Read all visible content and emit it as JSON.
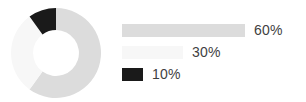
{
  "chart_data": {
    "type": "pie",
    "variant": "donut",
    "title": "",
    "subtitle": "",
    "xlabel": "",
    "ylabel": "",
    "grid": false,
    "legend_position": "right",
    "start_angle_deg": 0,
    "direction": "clockwise",
    "inner_radius_ratio": 0.51,
    "labels": [
      "60%",
      "30%",
      "10%"
    ],
    "values": [
      60,
      30,
      10
    ],
    "value_suffix": "%",
    "colors": [
      "#dcdcdc",
      "#f7f7f7",
      "#1a1a1a"
    ],
    "slices": [
      {
        "label": "60%",
        "value": 60,
        "color": "#dcdcdc",
        "start_angle_deg": 0,
        "sweep_deg": 216,
        "legend_bar_width_px": 123
      },
      {
        "label": "30%",
        "value": 30,
        "color": "#f7f7f7",
        "start_angle_deg": 216,
        "sweep_deg": 108,
        "legend_bar_width_px": 61
      },
      {
        "label": "10%",
        "value": 10,
        "color": "#1a1a1a",
        "start_angle_deg": 324,
        "sweep_deg": 36,
        "legend_bar_width_px": 21
      }
    ]
  },
  "legend": {
    "rows": [
      {
        "label": "60%"
      },
      {
        "label": "30%"
      },
      {
        "label": "10%"
      }
    ]
  },
  "colors": {
    "background": "#ffffff",
    "text": "#3f3f3f",
    "slice_large": "#dcdcdc",
    "slice_medium": "#f7f7f7",
    "slice_small": "#1a1a1a"
  }
}
